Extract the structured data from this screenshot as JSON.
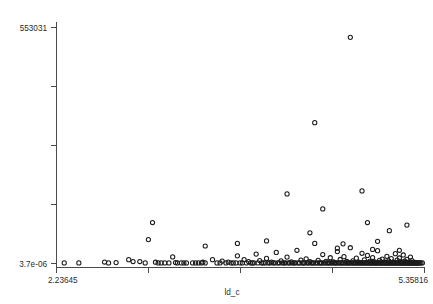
{
  "chart_data": {
    "type": "scatter",
    "title": "",
    "xlabel": "ld_c",
    "ylabel": "",
    "xtick_labels": [
      "2.23645",
      "",
      "",
      "",
      "5.35816"
    ],
    "ytick_labels": [
      "553031",
      "",
      "",
      "",
      "3.7e-06"
    ],
    "xlim": [
      2.23645,
      5.35816
    ],
    "ylim": [
      3.7e-06,
      553031
    ],
    "grid": false,
    "legend": null,
    "marker": "open-circle",
    "marker_color": "#1c1c1c",
    "n_points": 247,
    "points": [
      [
        2.302,
        1400
      ],
      [
        2.426,
        1400
      ],
      [
        2.644,
        3500
      ],
      [
        2.678,
        1400
      ],
      [
        2.742,
        2200
      ],
      [
        2.849,
        9000
      ],
      [
        2.886,
        4600
      ],
      [
        2.943,
        4600
      ],
      [
        2.989,
        1400
      ],
      [
        3.016,
        56000
      ],
      [
        3.076,
        3000
      ],
      [
        3.099,
        1400
      ],
      [
        3.124,
        1400
      ],
      [
        3.155,
        1400
      ],
      [
        3.19,
        1400
      ],
      [
        3.222,
        15500
      ],
      [
        3.246,
        2200
      ],
      [
        3.262,
        1400
      ],
      [
        3.295,
        1400
      ],
      [
        3.317,
        1400
      ],
      [
        3.339,
        1400
      ],
      [
        3.391,
        1400
      ],
      [
        3.416,
        1400
      ],
      [
        3.44,
        1400
      ],
      [
        3.466,
        1400
      ],
      [
        3.478,
        3000
      ],
      [
        3.498,
        1400
      ],
      [
        3.051,
        96000
      ],
      [
        3.56,
        9000
      ],
      [
        3.598,
        1400
      ],
      [
        3.624,
        1400
      ],
      [
        3.642,
        5600
      ],
      [
        3.674,
        1400
      ],
      [
        3.693,
        3400
      ],
      [
        3.718,
        1400
      ],
      [
        3.736,
        1400
      ],
      [
        3.759,
        1400
      ],
      [
        3.771,
        18000
      ],
      [
        3.794,
        1400
      ],
      [
        3.813,
        1400
      ],
      [
        3.828,
        9000
      ],
      [
        3.848,
        1400
      ],
      [
        3.866,
        4400
      ],
      [
        3.884,
        1400
      ],
      [
        3.898,
        1400
      ],
      [
        3.912,
        1400
      ],
      [
        3.93,
        22000
      ],
      [
        3.945,
        1400
      ],
      [
        3.96,
        6800
      ],
      [
        3.976,
        1400
      ],
      [
        3.99,
        1400
      ],
      [
        4.006,
        1400
      ],
      [
        4.018,
        12000
      ],
      [
        4.032,
        1400
      ],
      [
        4.046,
        1400
      ],
      [
        4.06,
        3200
      ],
      [
        4.074,
        1400
      ],
      [
        4.088,
        1400
      ],
      [
        4.101,
        26000
      ],
      [
        4.114,
        1400
      ],
      [
        4.128,
        1400
      ],
      [
        4.141,
        6000
      ],
      [
        4.154,
        1400
      ],
      [
        4.166,
        1400
      ],
      [
        4.179,
        1400
      ],
      [
        4.192,
        15000
      ],
      [
        4.204,
        1400
      ],
      [
        4.216,
        1400
      ],
      [
        4.228,
        3800
      ],
      [
        4.24,
        1400
      ],
      [
        4.252,
        1400
      ],
      [
        4.264,
        1400
      ],
      [
        4.276,
        31000
      ],
      [
        4.287,
        1400
      ],
      [
        4.299,
        1400
      ],
      [
        4.31,
        8000
      ],
      [
        4.321,
        1400
      ],
      [
        4.332,
        1400
      ],
      [
        4.343,
        1400
      ],
      [
        4.354,
        11000
      ],
      [
        4.365,
        1400
      ],
      [
        4.375,
        1400
      ],
      [
        4.386,
        4200
      ],
      [
        4.396,
        1400
      ],
      [
        4.406,
        1400
      ],
      [
        4.417,
        1400
      ],
      [
        4.427,
        47000
      ],
      [
        4.437,
        1400
      ],
      [
        4.447,
        1400
      ],
      [
        4.456,
        7200
      ],
      [
        4.466,
        1400
      ],
      [
        4.476,
        1400
      ],
      [
        4.485,
        1400
      ],
      [
        4.495,
        21000
      ],
      [
        4.504,
        1400
      ],
      [
        4.513,
        1400
      ],
      [
        4.523,
        5200
      ],
      [
        4.532,
        1400
      ],
      [
        4.541,
        1400
      ],
      [
        4.55,
        1400
      ],
      [
        4.559,
        13500
      ],
      [
        4.567,
        1400
      ],
      [
        4.576,
        1400
      ],
      [
        4.585,
        3600
      ],
      [
        4.593,
        1400
      ],
      [
        4.602,
        1400
      ],
      [
        4.61,
        1400
      ],
      [
        4.619,
        28000
      ],
      [
        4.627,
        1400
      ],
      [
        4.635,
        1400
      ],
      [
        4.643,
        9500
      ],
      [
        4.651,
        1400
      ],
      [
        4.659,
        1400
      ],
      [
        4.667,
        1400
      ],
      [
        4.675,
        16000
      ],
      [
        4.683,
        1400
      ],
      [
        4.691,
        1400
      ],
      [
        4.699,
        4800
      ],
      [
        4.706,
        1400
      ],
      [
        4.714,
        1400
      ],
      [
        4.721,
        1400
      ],
      [
        4.729,
        37000
      ],
      [
        4.736,
        1400
      ],
      [
        4.744,
        1400
      ],
      [
        4.751,
        6400
      ],
      [
        4.758,
        1400
      ],
      [
        4.766,
        1400
      ],
      [
        4.773,
        1400
      ],
      [
        4.78,
        12500
      ],
      [
        4.787,
        1400
      ],
      [
        4.794,
        1400
      ],
      [
        4.801,
        3300
      ],
      [
        4.808,
        1400
      ],
      [
        4.815,
        1400
      ],
      [
        4.822,
        1400
      ],
      [
        4.828,
        24000
      ],
      [
        4.835,
        1400
      ],
      [
        4.842,
        1400
      ],
      [
        4.848,
        8500
      ],
      [
        4.855,
        1400
      ],
      [
        4.861,
        1400
      ],
      [
        4.868,
        1400
      ],
      [
        4.874,
        19000
      ],
      [
        4.881,
        1400
      ],
      [
        4.887,
        1400
      ],
      [
        4.893,
        5000
      ],
      [
        4.9,
        1400
      ],
      [
        4.906,
        1400
      ],
      [
        4.912,
        1400
      ],
      [
        4.918,
        14000
      ],
      [
        4.924,
        1400
      ],
      [
        4.93,
        1400
      ],
      [
        4.936,
        3900
      ],
      [
        4.942,
        1400
      ],
      [
        4.948,
        1400
      ],
      [
        4.954,
        1400
      ],
      [
        4.96,
        30000
      ],
      [
        4.966,
        1400
      ],
      [
        4.972,
        1400
      ],
      [
        4.977,
        7600
      ],
      [
        4.983,
        1400
      ],
      [
        4.989,
        1400
      ],
      [
        4.994,
        1400
      ],
      [
        5.0,
        10500
      ],
      [
        5.006,
        1400
      ],
      [
        5.011,
        1400
      ],
      [
        5.017,
        4000
      ],
      [
        5.022,
        1400
      ],
      [
        5.028,
        1400
      ],
      [
        5.033,
        1400
      ],
      [
        5.039,
        17000
      ],
      [
        5.044,
        1400
      ],
      [
        5.049,
        1400
      ],
      [
        5.055,
        6200
      ],
      [
        5.06,
        1400
      ],
      [
        5.065,
        1400
      ],
      [
        5.07,
        1400
      ],
      [
        5.076,
        11500
      ],
      [
        5.081,
        1400
      ],
      [
        5.086,
        1400
      ],
      [
        5.091,
        3100
      ],
      [
        5.096,
        1400
      ],
      [
        5.101,
        1400
      ],
      [
        5.106,
        1400
      ],
      [
        5.111,
        23000
      ],
      [
        5.116,
        1400
      ],
      [
        5.121,
        1400
      ],
      [
        5.126,
        8200
      ],
      [
        5.131,
        1400
      ],
      [
        5.136,
        1400
      ],
      [
        5.14,
        1400
      ],
      [
        5.145,
        13000
      ],
      [
        5.15,
        1400
      ],
      [
        5.155,
        1400
      ],
      [
        5.159,
        4500
      ],
      [
        5.164,
        1400
      ],
      [
        5.169,
        1400
      ],
      [
        5.173,
        1400
      ],
      [
        5.178,
        20000
      ],
      [
        5.182,
        1400
      ],
      [
        5.187,
        1400
      ],
      [
        5.191,
        5800
      ],
      [
        5.196,
        1400
      ],
      [
        5.2,
        1400
      ],
      [
        5.205,
        1400
      ],
      [
        5.209,
        9800
      ],
      [
        5.213,
        1400
      ],
      [
        5.218,
        1400
      ],
      [
        5.222,
        3400
      ],
      [
        5.226,
        1400
      ],
      [
        5.23,
        1400
      ],
      [
        5.235,
        1400
      ],
      [
        5.239,
        15000
      ],
      [
        5.243,
        1400
      ],
      [
        5.247,
        1400
      ],
      [
        5.251,
        7000
      ],
      [
        5.255,
        1400
      ],
      [
        5.259,
        1400
      ],
      [
        5.264,
        1400
      ],
      [
        5.268,
        1400
      ],
      [
        5.272,
        1400
      ],
      [
        5.276,
        2900
      ],
      [
        5.28,
        1400
      ],
      [
        5.284,
        1400
      ],
      [
        5.29,
        1400
      ],
      [
        5.296,
        1400
      ],
      [
        5.302,
        1400
      ],
      [
        5.31,
        1400
      ],
      [
        5.318,
        1400
      ],
      [
        5.328,
        1400
      ],
      [
        5.34,
        1400
      ],
      [
        4.386,
        72000
      ],
      [
        4.667,
        46000
      ],
      [
        4.427,
        330000
      ],
      [
        4.192,
        163000
      ],
      [
        4.874,
        96000
      ],
      [
        4.495,
        128000
      ],
      [
        5.06,
        77000
      ],
      [
        4.96,
        52000
      ],
      [
        3.771,
        47000
      ],
      [
        4.018,
        53000
      ],
      [
        4.729,
        530000
      ],
      [
        5.209,
        90000
      ],
      [
        4.619,
        36000
      ],
      [
        4.918,
        33000
      ],
      [
        5.145,
        31000
      ],
      [
        3.498,
        41000
      ],
      [
        4.828,
        170000
      ]
    ],
    "outliers": [
      {
        "label": "peak-high",
        "x": 4.729,
        "y": 530000
      },
      {
        "label": "peak-mid-right",
        "x": 5.255,
        "y": 330000
      },
      {
        "label": "peak-mid-left",
        "x": 3.317,
        "y": 305000
      }
    ]
  },
  "axes": {
    "x_axis_name": "x-axis",
    "y_axis_name": "y-axis",
    "x_title": "ld_c",
    "x_min_label": "2.23645",
    "x_max_label": "5.35816",
    "y_max_label": "553031",
    "y_min_label": "3.7e-06"
  }
}
